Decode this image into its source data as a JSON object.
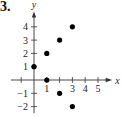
{
  "figure_label": "3.",
  "chart_data": {
    "type": "scatter",
    "title": "",
    "xlabel": "x",
    "ylabel": "y",
    "xlim": [
      -2,
      6
    ],
    "ylim": [
      -2.5,
      5
    ],
    "x_ticks": [
      1,
      2,
      3,
      4,
      5
    ],
    "x_tick_labels": [
      "1",
      "",
      "3",
      "4",
      "5"
    ],
    "y_ticks": [
      -2,
      -1,
      1,
      2,
      3,
      4
    ],
    "y_tick_labels": [
      "−2",
      "−1",
      "1",
      "2",
      "3",
      "4"
    ],
    "grid": false,
    "series": [
      {
        "name": "points",
        "points": [
          {
            "x": 0,
            "y": 1
          },
          {
            "x": 1,
            "y": 0
          },
          {
            "x": 1,
            "y": 2
          },
          {
            "x": 2,
            "y": 3
          },
          {
            "x": 3,
            "y": 4
          },
          {
            "x": 2,
            "y": -1
          },
          {
            "x": 3,
            "y": -2
          }
        ]
      }
    ]
  }
}
